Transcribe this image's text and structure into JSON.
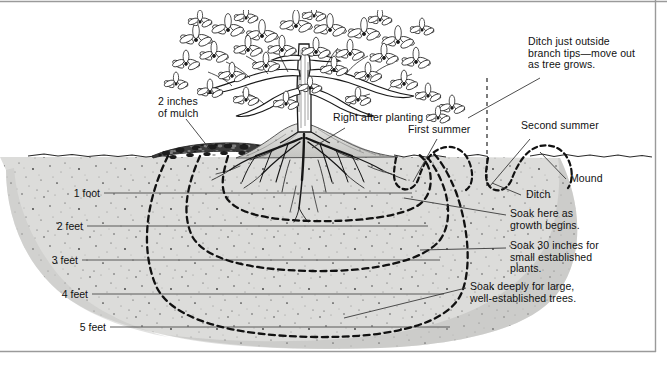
{
  "figure": {
    "colors": {
      "soil": "#dcdcda",
      "soil_shadow": "#c9c9c6",
      "mulch": "#3a3a3a",
      "ink": "#111111",
      "frame": "#8a8a8a",
      "background": "#ffffff"
    }
  },
  "callouts": [
    {
      "id": "mulch",
      "text": "2 inches\nof mulch"
    },
    {
      "id": "right-after-planting",
      "text": "Right after planting"
    },
    {
      "id": "ditch-outside",
      "text": "Ditch just outside\nbranch tips—move out\nas tree grows."
    },
    {
      "id": "first-summer",
      "text": "First summer"
    },
    {
      "id": "second-summer",
      "text": "Second summer"
    },
    {
      "id": "mound",
      "text": "Mound"
    },
    {
      "id": "ditch",
      "text": "Ditch"
    },
    {
      "id": "soak-growth",
      "text": "Soak here as\ngrowth begins."
    },
    {
      "id": "soak-30",
      "text": "Soak 30 inches for\nsmall established\nplants."
    },
    {
      "id": "soak-deep",
      "text": "Soak deeply for large,\nwell-established trees."
    }
  ],
  "depth_scale": {
    "unit": "feet",
    "marks": [
      {
        "label": "1 foot",
        "y": 193
      },
      {
        "label": "2 feet",
        "y": 226
      },
      {
        "label": "3 feet",
        "y": 260
      },
      {
        "label": "4 feet",
        "y": 294
      },
      {
        "label": "5 feet",
        "y": 327
      }
    ]
  }
}
